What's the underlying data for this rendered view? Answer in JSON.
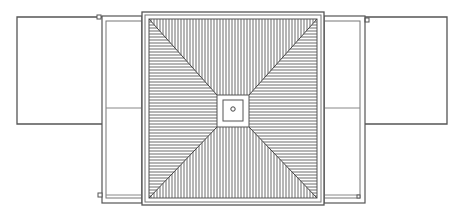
{
  "diagram": {
    "title": "Top view: hatched square unit with central fixture and two hinged side panels",
    "colors": {
      "background": "#ffffff",
      "line": "#555555",
      "hatch": "#6b6b6b",
      "light_line": "#9a9a9a"
    },
    "components": [
      {
        "id": "central-unit",
        "label": "Central hatched square with diagonal divisions"
      },
      {
        "id": "center-fixture",
        "label": "Central square fixture with round hole"
      },
      {
        "id": "left-door-leaf",
        "label": "Left frame leaf"
      },
      {
        "id": "left-open-panel",
        "label": "Left opened panel"
      },
      {
        "id": "right-door-leaf",
        "label": "Right frame leaf"
      },
      {
        "id": "right-open-panel",
        "label": "Right opened panel"
      }
    ]
  }
}
